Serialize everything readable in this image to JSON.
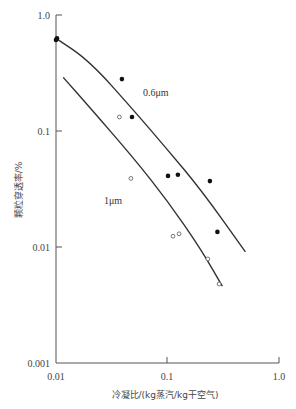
{
  "chart_data": {
    "type": "scatter",
    "title": "",
    "xlabel": "冷凝比/(kg蒸汽/kg干空气)",
    "ylabel": "颗粒穿透率/%",
    "xscale": "log",
    "yscale": "log",
    "xlim": [
      0.01,
      1.0
    ],
    "ylim": [
      0.001,
      1.0
    ],
    "x_ticks": [
      "0.01",
      "0.1",
      "1.0"
    ],
    "y_ticks": [
      "0.001",
      "0.01",
      "0.1",
      "1.0"
    ],
    "grid": false,
    "legend": "inline curve labels",
    "series": [
      {
        "name": "0.6μm",
        "marker": "filled-circle",
        "points": [
          {
            "x": 0.01,
            "y": 0.61
          },
          {
            "x": 0.0102,
            "y": 0.63
          },
          {
            "x": 0.039,
            "y": 0.28
          },
          {
            "x": 0.048,
            "y": 0.132
          },
          {
            "x": 0.101,
            "y": 0.041
          },
          {
            "x": 0.124,
            "y": 0.042
          },
          {
            "x": 0.24,
            "y": 0.037
          },
          {
            "x": 0.28,
            "y": 0.0135
          }
        ],
        "fit_curve": [
          {
            "x": 0.01,
            "y": 0.63
          },
          {
            "x": 0.02,
            "y": 0.4
          },
          {
            "x": 0.05,
            "y": 0.15
          },
          {
            "x": 0.1,
            "y": 0.069
          },
          {
            "x": 0.2,
            "y": 0.031
          },
          {
            "x": 0.5,
            "y": 0.0091
          }
        ],
        "label_position": {
          "x": 0.065,
          "y": 0.22
        }
      },
      {
        "name": "1μm",
        "marker": "open-circle",
        "points": [
          {
            "x": 0.037,
            "y": 0.132
          },
          {
            "x": 0.047,
            "y": 0.039
          },
          {
            "x": 0.112,
            "y": 0.0124
          },
          {
            "x": 0.127,
            "y": 0.013
          },
          {
            "x": 0.23,
            "y": 0.0079
          },
          {
            "x": 0.29,
            "y": 0.0048
          }
        ],
        "fit_curve": [
          {
            "x": 0.0116,
            "y": 0.29
          },
          {
            "x": 0.02,
            "y": 0.16
          },
          {
            "x": 0.05,
            "y": 0.058
          },
          {
            "x": 0.1,
            "y": 0.025
          },
          {
            "x": 0.2,
            "y": 0.0095
          },
          {
            "x": 0.31,
            "y": 0.0046
          }
        ],
        "label_position": {
          "x": 0.036,
          "y": 0.03
        }
      }
    ]
  },
  "axes": {
    "x_title": "冷凝比/(kg蒸汽/kg干空气)",
    "y_title": "颗粒穿透率/%",
    "x_tick_labels": [
      "0.01",
      "0.1",
      "1.0"
    ],
    "y_tick_labels": [
      "1.0",
      "0.1",
      "0.01",
      "0.001"
    ]
  },
  "labels": {
    "series_a": "0.6μm",
    "series_b": "1μm"
  },
  "colors": {
    "axis": "#555555",
    "line": "#333333",
    "marker": "#111111"
  }
}
